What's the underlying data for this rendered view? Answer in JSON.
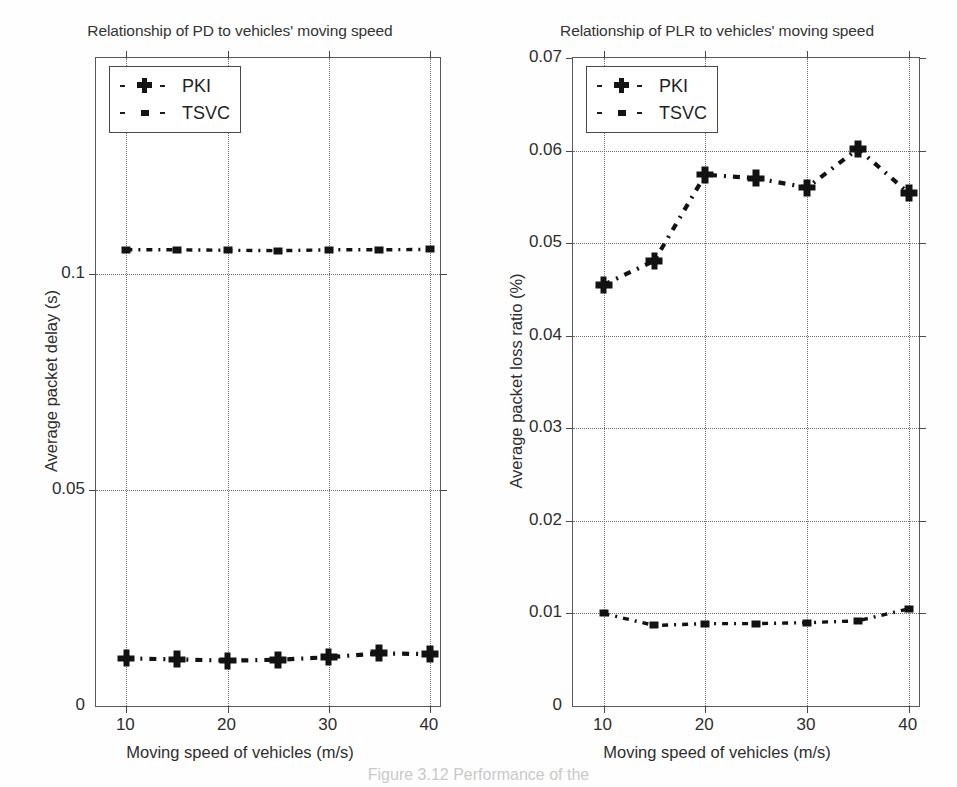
{
  "figure": {
    "background": "#ffffff",
    "line_color": "#121212",
    "grid_color": "#6e6e6e",
    "axis_color": "#4a4a4a",
    "caption_partial": "Figure 3.12   Performance of the"
  },
  "charts": [
    {
      "id": "chart-pd",
      "chart_data": {
        "type": "line",
        "title": "Relationship of PD to vehicles' moving speed",
        "xlabel": "Moving speed of vehicles (m/s)",
        "ylabel": "Average packet delay (s)",
        "xlim": [
          7,
          41
        ],
        "ylim": [
          0,
          0.15
        ],
        "xticks": [
          10,
          20,
          30,
          40
        ],
        "xtick_labels": [
          "10",
          "20",
          "30",
          "40"
        ],
        "yticks": [
          0,
          0.05,
          0.1
        ],
        "ytick_labels": [
          "0",
          "0.05",
          "0.1"
        ],
        "grid": true,
        "grid_style": "dotted",
        "legend_position": "top-left",
        "x": [
          10,
          15,
          20,
          25,
          30,
          35,
          40
        ],
        "series": [
          {
            "name": "PKI",
            "marker": "plus",
            "linestyle": "dashdot",
            "values": [
              0.011,
              0.0108,
              0.0105,
              0.0107,
              0.0113,
              0.0122,
              0.012
            ]
          },
          {
            "name": "TSVC",
            "marker": "small-square",
            "linestyle": "dashdot",
            "values": [
              0.1056,
              0.1056,
              0.1055,
              0.1054,
              0.1056,
              0.1056,
              0.1057
            ]
          }
        ]
      }
    },
    {
      "id": "chart-plr",
      "chart_data": {
        "type": "line",
        "title": "Relationship of PLR to vehicles' moving speed",
        "xlabel": "Moving speed of vehicles (m/s)",
        "ylabel": "Average packet loss ratio (%)",
        "xlim": [
          7,
          41
        ],
        "ylim": [
          0,
          0.07
        ],
        "xticks": [
          10,
          20,
          30,
          40
        ],
        "xtick_labels": [
          "10",
          "20",
          "30",
          "40"
        ],
        "yticks": [
          0,
          0.01,
          0.02,
          0.03,
          0.04,
          0.05,
          0.06,
          0.07
        ],
        "ytick_labels": [
          "0",
          "0.01",
          "0.02",
          "0.03",
          "0.04",
          "0.05",
          "0.06",
          "0.07"
        ],
        "grid": true,
        "grid_style": "dotted",
        "legend_position": "top-left",
        "x": [
          10,
          15,
          20,
          25,
          30,
          35,
          40
        ],
        "series": [
          {
            "name": "PKI",
            "marker": "plus",
            "linestyle": "dashdot",
            "values": [
              0.0455,
              0.0481,
              0.0574,
              0.057,
              0.056,
              0.0602,
              0.0554
            ]
          },
          {
            "name": "TSVC",
            "marker": "small-square",
            "linestyle": "dashdot",
            "values": [
              0.01,
              0.0087,
              0.0089,
              0.0089,
              0.009,
              0.0092,
              0.0105
            ]
          }
        ]
      }
    }
  ]
}
